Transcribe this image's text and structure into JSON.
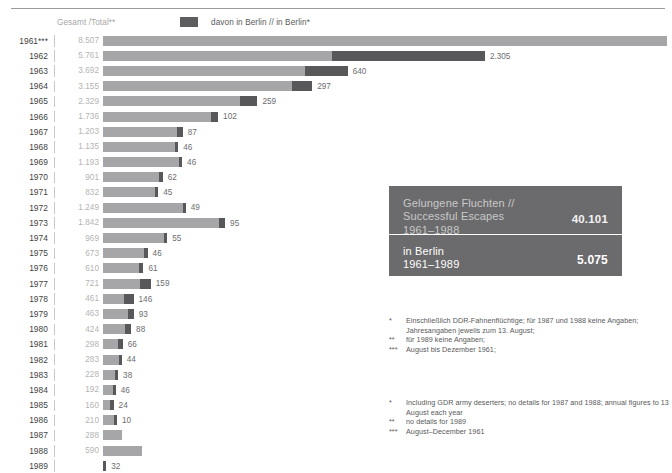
{
  "legend": {
    "total_label": "Gesamt /Total**",
    "berlin_label": "davon in Berlin // in Berlin*",
    "swatch_name": "berlin-swatch"
  },
  "info_box": {
    "title_de": "Gelungene Fluchten //",
    "title_en": "Successful Escapes",
    "period_total": "1961–1988",
    "value_total": "40.101",
    "label_berlin": "in Berlin",
    "period_berlin": "1961–1989",
    "value_berlin": "5.075"
  },
  "footnotes_de": [
    {
      "mark": "*",
      "text": "Einschließlich DDR-Fahnenflüchtige; für 1987 und 1988 keine Angaben; Jahresangaben jeweils zum 13. August;"
    },
    {
      "mark": "**",
      "text": "für 1989 keine Angaben;"
    },
    {
      "mark": "***",
      "text": "August bis Dezember 1961;"
    }
  ],
  "footnotes_en": [
    {
      "mark": "*",
      "text": "Including GDR army deserters; no details for 1987 and 1988; annual figures to 13 August each year"
    },
    {
      "mark": "**",
      "text": "no details for 1989"
    },
    {
      "mark": "***",
      "text": "August–December 1961"
    }
  ],
  "colors": {
    "bar_total": "#a6a6a8",
    "bar_berlin": "#58585a",
    "info_box_bg": "#6b6b6d",
    "total_text": "#b4b4b4",
    "year_text": "#3f3f41"
  },
  "chart_data": {
    "type": "bar",
    "orientation": "horizontal",
    "title": "",
    "xlabel": "",
    "ylabel": "",
    "stacked": true,
    "grid": false,
    "legend_position": "top",
    "xlim": [
      0,
      8507
    ],
    "categories": [
      "1961***",
      "1962",
      "1963",
      "1964",
      "1965",
      "1966",
      "1967",
      "1968",
      "1969",
      "1970",
      "1971",
      "1972",
      "1973",
      "1974",
      "1975",
      "1976",
      "1977",
      "1978",
      "1979",
      "1980",
      "1981",
      "1982",
      "1983",
      "1984",
      "1985",
      "1986",
      "1987",
      "1988",
      "1989"
    ],
    "series": [
      {
        "name": "Gesamt /Total**",
        "values": [
          8507,
          5761,
          3692,
          3155,
          2329,
          1736,
          1203,
          1135,
          1193,
          901,
          832,
          1249,
          1842,
          969,
          673,
          610,
          721,
          461,
          463,
          424,
          298,
          283,
          228,
          192,
          160,
          210,
          288,
          590,
          null
        ]
      },
      {
        "name": "davon in Berlin // in Berlin*",
        "values": [
          null,
          2305,
          640,
          297,
          259,
          102,
          87,
          46,
          46,
          62,
          45,
          49,
          95,
          55,
          46,
          61,
          159,
          146,
          93,
          88,
          66,
          44,
          38,
          46,
          24,
          10,
          null,
          null,
          32
        ]
      }
    ],
    "total_labels": [
      "8.507",
      "5.761",
      "3.692",
      "3.155",
      "2.329",
      "1.736",
      "1.203",
      "1.135",
      "1.193",
      "901",
      "832",
      "1.249",
      "1.842",
      "969",
      "673",
      "610",
      "721",
      "461",
      "463",
      "424",
      "298",
      "283",
      "228",
      "192",
      "160",
      "210",
      "288",
      "590",
      ""
    ],
    "berlin_labels": [
      "",
      "2.305",
      "640",
      "297",
      "259",
      "102",
      "87",
      "46",
      "46",
      "62",
      "45",
      "49",
      "95",
      "55",
      "46",
      "61",
      "159",
      "146",
      "93",
      "88",
      "66",
      "44",
      "38",
      "46",
      "24",
      "10",
      "",
      "",
      "32"
    ]
  }
}
